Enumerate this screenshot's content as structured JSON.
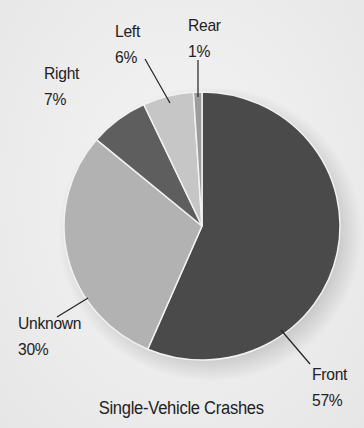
{
  "chart_data": {
    "type": "pie",
    "title": "Single-Vehicle Crashes",
    "start_angle_deg": 0,
    "direction": "clockwise",
    "slices": [
      {
        "label": "Front",
        "value": 57,
        "display": "57%",
        "color": "#4a4a4a"
      },
      {
        "label": "Unknown",
        "value": 30,
        "display": "30%",
        "color": "#b2b2b2"
      },
      {
        "label": "Right",
        "value": 7,
        "display": "7%",
        "color": "#5e5e5e"
      },
      {
        "label": "Left",
        "value": 6,
        "display": "6%",
        "color": "#c6c6c6"
      },
      {
        "label": "Rear",
        "value": 1,
        "display": "1%",
        "color": "#9c9c9c"
      }
    ],
    "legend": "none (callout labels with leader lines)"
  },
  "labels": {
    "front": {
      "name": "Front",
      "pct": "57%"
    },
    "unknown": {
      "name": "Unknown",
      "pct": "30%"
    },
    "right": {
      "name": "Right",
      "pct": "7%"
    },
    "left": {
      "name": "Left",
      "pct": "6%"
    },
    "rear": {
      "name": "Rear",
      "pct": "1%"
    }
  },
  "title": "Single-Vehicle Crashes"
}
